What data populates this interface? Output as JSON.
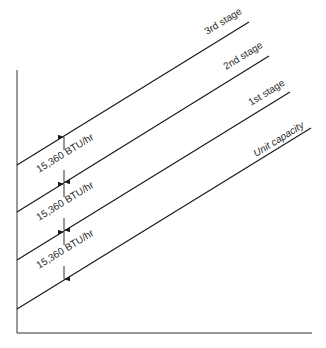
{
  "diagram": {
    "axes": {
      "origin": [
        17,
        333
      ],
      "y_top": 70,
      "x_right": 312
    },
    "stage_lines": [
      {
        "label": "3rd stage",
        "start": [
          17,
          165
        ],
        "end": [
          249,
          22
        ],
        "label_pos": [
          215,
          20
        ]
      },
      {
        "label": "2nd stage",
        "start": [
          17,
          212
        ],
        "end": [
          269,
          56
        ],
        "label_pos": [
          234,
          55
        ]
      },
      {
        "label": "1st stage",
        "start": [
          17,
          260
        ],
        "end": [
          290,
          92
        ],
        "label_pos": [
          256,
          90
        ]
      },
      {
        "label": "Unit capacity",
        "start": [
          17,
          309
        ],
        "end": [
          311,
          128
        ],
        "label_pos": [
          256,
          133
        ]
      }
    ],
    "intervals": [
      {
        "label": "15,360 BTU/hr",
        "top_y": 136,
        "bottom_y": 183,
        "arrow_x": 64
      },
      {
        "label": "15,360 BTU/hr",
        "top_y": 183,
        "bottom_y": 231,
        "arrow_x": 64
      },
      {
        "label": "15,360 BTU/hr",
        "top_y": 231,
        "bottom_y": 280,
        "arrow_x": 64
      }
    ]
  }
}
